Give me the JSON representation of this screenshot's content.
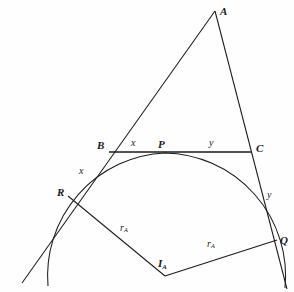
{
  "figure": {
    "background_color": "#fefefe",
    "stroke_color": "#1a1a1a",
    "width": 294,
    "height": 292
  },
  "labels": {
    "vertex_a": "A",
    "vertex_b": "B",
    "vertex_c": "C",
    "point_p": "P",
    "point_q": "Q",
    "point_r": "R",
    "center_i": "I",
    "center_i_sub": "A",
    "seg_bp": "x",
    "seg_br": "x",
    "seg_pc": "y",
    "seg_cq": "y",
    "radius_left": "r",
    "radius_left_sub": "A",
    "radius_right": "r",
    "radius_right_sub": "A"
  },
  "geometry": {
    "points": {
      "A": [
        215,
        11
      ],
      "B": [
        109,
        152
      ],
      "C": [
        251,
        152
      ],
      "P": [
        160,
        153
      ],
      "Q": [
        277,
        240
      ],
      "R": [
        68,
        196
      ],
      "I": [
        165,
        276
      ]
    },
    "ray_ends": {
      "AB_extended": [
        22,
        283
      ],
      "AC_extended": [
        287,
        289
      ],
      "circle_left_tail": [
        48,
        286
      ],
      "circle_right_tail": [
        285,
        288
      ]
    },
    "circle": {
      "center": [
        165,
        276
      ],
      "radius": 123
    }
  }
}
